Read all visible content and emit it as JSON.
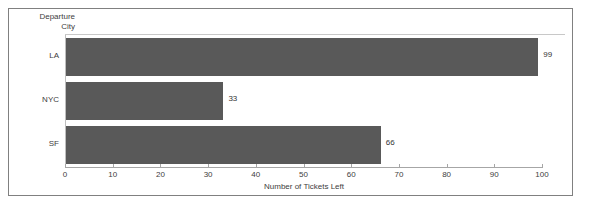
{
  "chart_data": {
    "type": "bar",
    "orientation": "horizontal",
    "title": "",
    "xlabel": "Number of Tickets Left",
    "ylabel": "Departure\nCity",
    "categories": [
      "LA",
      "NYC",
      "SF"
    ],
    "values": [
      99,
      33,
      66
    ],
    "value_labels": [
      "99",
      "33",
      "66"
    ],
    "xlim": [
      0,
      100
    ],
    "xticks": [
      0,
      10,
      20,
      30,
      40,
      50,
      60,
      70,
      80,
      90,
      100
    ],
    "xtick_labels": [
      "0",
      "10",
      "20",
      "30",
      "40",
      "50",
      "60",
      "70",
      "80",
      "90",
      "100"
    ],
    "grid": false,
    "legend": false,
    "bar_color": "#595959",
    "background_color": "#ffffff",
    "border_color": "#808080"
  }
}
